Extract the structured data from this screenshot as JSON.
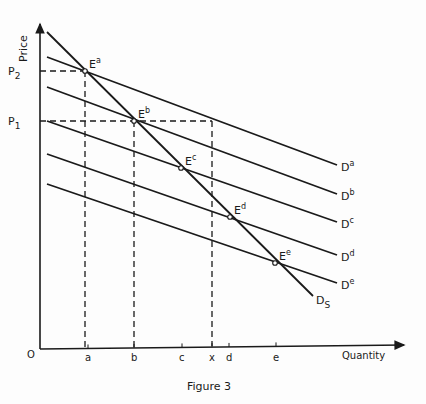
{
  "figure": {
    "caption": "Figure 3",
    "y_axis_label": "Price",
    "x_axis_label": "Quantity",
    "origin_label": "O",
    "price_labels": [
      {
        "main": "P",
        "sub": "2",
        "y": 71
      },
      {
        "main": "P",
        "sub": "1",
        "y": 121
      }
    ],
    "quantity_labels": [
      {
        "text": "a",
        "x": 88
      },
      {
        "text": "b",
        "x": 134
      },
      {
        "text": "c",
        "x": 182
      },
      {
        "text": "x",
        "x": 212
      },
      {
        "text": "d",
        "x": 229
      },
      {
        "text": "e",
        "x": 276
      }
    ],
    "demand_curves": [
      {
        "main": "D",
        "sup": "a",
        "x1": 47,
        "y1": 57,
        "x2": 337,
        "y2": 165
      },
      {
        "main": "D",
        "sup": "b",
        "x1": 47,
        "y1": 87,
        "x2": 337,
        "y2": 194
      },
      {
        "main": "D",
        "sup": "c",
        "x1": 47,
        "y1": 121,
        "x2": 337,
        "y2": 222
      },
      {
        "main": "D",
        "sup": "d",
        "x1": 47,
        "y1": 154,
        "x2": 337,
        "y2": 255
      },
      {
        "main": "D",
        "sup": "e",
        "x1": 47,
        "y1": 184,
        "x2": 337,
        "y2": 283
      }
    ],
    "supply_curve": {
      "main": "D",
      "sub": "S",
      "x1": 47,
      "y1": 32,
      "x2": 313,
      "y2": 296
    },
    "equilibria": [
      {
        "main": "E",
        "sup": "a",
        "x": 85,
        "y": 71
      },
      {
        "main": "E",
        "sup": "b",
        "x": 134,
        "y": 121
      },
      {
        "main": "E",
        "sup": "c",
        "x": 181,
        "y": 168
      },
      {
        "main": "E",
        "sup": "d",
        "x": 230,
        "y": 217
      },
      {
        "main": "E",
        "sup": "e",
        "x": 275,
        "y": 263
      }
    ],
    "colors": {
      "ink": "#1a1a1a",
      "paper": "#fdfdfd"
    }
  }
}
